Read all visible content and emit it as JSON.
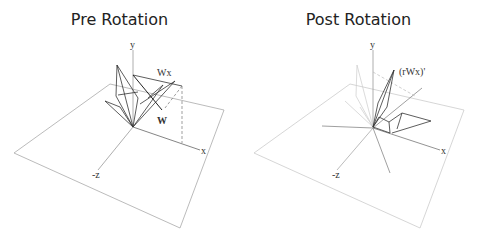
{
  "panels": [
    {
      "title": "Pre Rotation",
      "axis_labels": {
        "y": "y",
        "x": "x",
        "z": "-z"
      },
      "vector_labels": {
        "w": "W",
        "wx": "Wx"
      }
    },
    {
      "title": "Post Rotation",
      "axis_labels": {
        "y": "y",
        "x": "x",
        "z": "-z"
      },
      "vector_labels": {
        "rwx": "(rWx)'"
      }
    }
  ]
}
